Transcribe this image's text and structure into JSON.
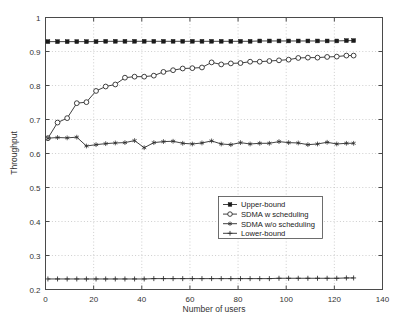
{
  "chart_data": {
    "type": "line",
    "title": "",
    "xlabel": "Number of users",
    "ylabel": "Throughput",
    "xlim": [
      0,
      140
    ],
    "ylim": [
      0.2,
      1.0
    ],
    "xticks": [
      0,
      20,
      40,
      60,
      80,
      100,
      120,
      140
    ],
    "xtick_labels": [
      "0",
      "20",
      "40",
      "60",
      "80",
      "100",
      "120",
      "140"
    ],
    "yticks": [
      0.2,
      0.3,
      0.4,
      0.5,
      0.6,
      0.7,
      0.8,
      0.9,
      1
    ],
    "ytick_labels": [
      "0.2",
      "0.3",
      "0.4",
      "0.5",
      "0.6",
      "0.7",
      "0.8",
      "0.9",
      "1"
    ],
    "grid": true,
    "grid_style": "dotted",
    "legend_position": "center-right",
    "x": [
      1,
      5,
      9,
      13,
      17,
      21,
      25,
      29,
      33,
      37,
      41,
      45,
      49,
      53,
      57,
      61,
      65,
      69,
      73,
      77,
      81,
      85,
      89,
      93,
      97,
      101,
      105,
      109,
      113,
      117,
      121,
      125,
      128
    ],
    "series": [
      {
        "name": "Upper-bound",
        "marker": "filled-square",
        "values": [
          0.929,
          0.929,
          0.929,
          0.929,
          0.929,
          0.929,
          0.93,
          0.93,
          0.93,
          0.93,
          0.93,
          0.93,
          0.93,
          0.93,
          0.93,
          0.93,
          0.93,
          0.93,
          0.93,
          0.93,
          0.93,
          0.93,
          0.931,
          0.931,
          0.931,
          0.931,
          0.931,
          0.931,
          0.931,
          0.931,
          0.931,
          0.932,
          0.932
        ]
      },
      {
        "name": "SDMA w scheduling",
        "marker": "open-circle",
        "values": [
          0.645,
          0.691,
          0.704,
          0.748,
          0.751,
          0.784,
          0.797,
          0.803,
          0.823,
          0.826,
          0.826,
          0.829,
          0.84,
          0.845,
          0.85,
          0.851,
          0.853,
          0.868,
          0.862,
          0.865,
          0.866,
          0.87,
          0.87,
          0.872,
          0.874,
          0.876,
          0.881,
          0.882,
          0.882,
          0.884,
          0.885,
          0.888,
          0.888
        ]
      },
      {
        "name": "SDMA w/o scheduling",
        "marker": "star",
        "values": [
          0.645,
          0.647,
          0.646,
          0.648,
          0.622,
          0.626,
          0.629,
          0.631,
          0.632,
          0.638,
          0.617,
          0.632,
          0.635,
          0.636,
          0.63,
          0.628,
          0.631,
          0.637,
          0.628,
          0.626,
          0.632,
          0.628,
          0.63,
          0.63,
          0.635,
          0.632,
          0.631,
          0.626,
          0.628,
          0.633,
          0.628,
          0.63,
          0.63
        ]
      },
      {
        "name": "Lower-bound",
        "marker": "plus",
        "values": [
          0.231,
          0.231,
          0.231,
          0.231,
          0.231,
          0.231,
          0.231,
          0.231,
          0.231,
          0.231,
          0.231,
          0.232,
          0.232,
          0.232,
          0.232,
          0.232,
          0.232,
          0.232,
          0.232,
          0.232,
          0.232,
          0.232,
          0.232,
          0.232,
          0.233,
          0.233,
          0.233,
          0.233,
          0.233,
          0.233,
          0.233,
          0.234,
          0.234
        ]
      }
    ]
  },
  "legend": {
    "items": [
      {
        "label": "Upper-bound",
        "marker": "filled-square"
      },
      {
        "label": "SDMA w scheduling",
        "marker": "open-circle"
      },
      {
        "label": "SDMA w/o scheduling",
        "marker": "star"
      },
      {
        "label": "Lower-bound",
        "marker": "plus"
      }
    ]
  },
  "colors": {
    "line": "#2b2b2b",
    "frame": "#4a4a4a",
    "grid": "#b9b9b9",
    "background": "#ffffff"
  }
}
